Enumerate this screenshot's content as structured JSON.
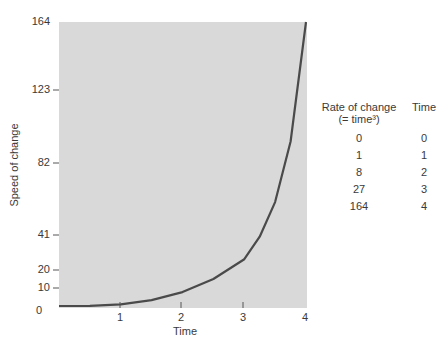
{
  "chart_data": {
    "type": "line",
    "title": "",
    "xlabel": "Time",
    "ylabel": "Speed of change",
    "x_ticks": [
      "1",
      "2",
      "3",
      "4"
    ],
    "y_ticks": [
      "0",
      "10",
      "20",
      "41",
      "82",
      "123",
      "164"
    ],
    "xlim": [
      0,
      4
    ],
    "ylim": [
      0,
      164
    ],
    "grid": false,
    "series": [
      {
        "name": "Rate of change (= time³)",
        "x": [
          0,
          0.5,
          1,
          1.5,
          2,
          2.5,
          3,
          3.25,
          3.5,
          3.75,
          4
        ],
        "y": [
          0,
          0.125,
          1,
          3.4,
          8,
          15.6,
          27,
          40,
          60,
          95,
          164
        ]
      }
    ],
    "table": {
      "headers": [
        "Rate of change",
        "Time"
      ],
      "header_sub": "(= time³)",
      "rows": [
        {
          "rate": "0",
          "time": "0"
        },
        {
          "rate": "1",
          "time": "1"
        },
        {
          "rate": "8",
          "time": "2"
        },
        {
          "rate": "27",
          "time": "3"
        },
        {
          "rate": "164",
          "time": "4"
        }
      ]
    },
    "colors": {
      "plot_background": "#d9d9d9",
      "line": "#4a4a4a"
    }
  }
}
